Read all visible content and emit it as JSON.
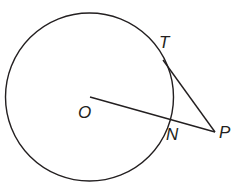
{
  "diagram": {
    "type": "circle-tangent-secant",
    "circle": {
      "center": "O",
      "cx": 89.5,
      "cy": 97,
      "r": 84
    },
    "points": {
      "O": {
        "x": 90,
        "y": 97
      },
      "T": {
        "x": 163,
        "y": 60
      },
      "N": {
        "x": 170,
        "y": 118
      },
      "P": {
        "x": 215,
        "y": 132
      }
    },
    "segments": [
      {
        "from": "O",
        "to": "P"
      },
      {
        "from": "T",
        "to": "P"
      }
    ],
    "labels": {
      "T": "T",
      "O": "O",
      "N": "N",
      "P": "P"
    },
    "colors": {
      "stroke": "#231f20",
      "background": "#ffffff"
    }
  }
}
